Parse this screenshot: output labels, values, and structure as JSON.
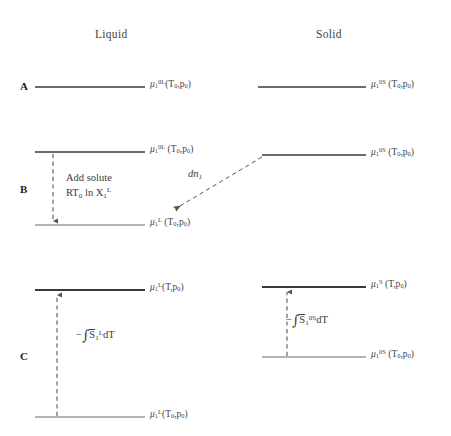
{
  "figure": {
    "background": "#ffffff",
    "width": 451,
    "height": 436
  },
  "colors": {
    "level_dark": "#3a3a3a",
    "level_light": "#9a9a9a",
    "arrow": "#555555",
    "text": "#3c3c3c",
    "row_label": "#1d1d1d"
  },
  "columns": [
    {
      "id": "liquid",
      "label": "Liquid",
      "x": 95,
      "y": 28
    },
    {
      "id": "solid",
      "label": "Solid",
      "x": 316,
      "y": 28
    }
  ],
  "rows": [
    {
      "id": "A",
      "label": "A",
      "x": 20,
      "y": 80
    },
    {
      "id": "B",
      "label": "B",
      "x": 20,
      "y": 183
    },
    {
      "id": "C",
      "label": "C",
      "x": 20,
      "y": 350
    }
  ],
  "levels": [
    {
      "id": "A-liquid",
      "row": "A",
      "column": "liquid",
      "x1": 35,
      "x2": 145,
      "y": 87,
      "shade": "dark",
      "label_html": "<span class=\"mu\">&mu;</span><sub>1</sub><sup>0L</sup>(T<sub>0</sub>,p<sub>0</sub>)",
      "label_text": "mu_1^0L (T0,p0)",
      "label_x": 150,
      "label_y": 80
    },
    {
      "id": "A-solid",
      "row": "A",
      "column": "solid",
      "x1": 258,
      "x2": 366,
      "y": 87,
      "shade": "dark",
      "label_html": "<span class=\"mu\">&mu;</span><sub>1</sub><sup>0S</sup> (T<sub>0</sub>,p<sub>0</sub>)",
      "label_text": "mu_1^0S (T0,p0)",
      "label_x": 371,
      "label_y": 80
    },
    {
      "id": "B-liquid-upper",
      "row": "B",
      "column": "liquid",
      "x1": 35,
      "x2": 145,
      "y": 152,
      "shade": "dark",
      "label_html": "<span class=\"mu\">&mu;</span><sub>1</sub><sup>0L</sup> (T<sub>0</sub>,p<sub>0</sub>)",
      "label_text": "mu_1^0L (T0,p0)",
      "label_x": 150,
      "label_y": 145
    },
    {
      "id": "B-liquid-lower",
      "row": "B",
      "column": "liquid",
      "x1": 35,
      "x2": 145,
      "y": 225,
      "shade": "light",
      "label_html": "<span class=\"mu\">&mu;</span><sub>1</sub><sup>L</sup> (T<sub>0</sub>,p<sub>0</sub>)",
      "label_text": "mu_1^L (T0,p0)",
      "label_x": 150,
      "label_y": 218
    },
    {
      "id": "B-solid",
      "row": "B",
      "column": "solid",
      "x1": 262,
      "x2": 366,
      "y": 155,
      "shade": "dark",
      "label_html": "<span class=\"mu\">&mu;</span><sub>1</sub><sup>0S</sup> (T<sub>0</sub>,p<sub>0</sub>)",
      "label_text": "mu_1^0S (T0,p0)",
      "label_x": 371,
      "label_y": 148
    },
    {
      "id": "C-liquid-upper",
      "row": "C",
      "column": "liquid",
      "x1": 35,
      "x2": 145,
      "y": 290,
      "shade": "dark",
      "label_html": "<span class=\"mu\">&mu;</span><sub>1</sub><sup>L</sup>(T,p<sub>0</sub>)",
      "label_text": "mu_1^L (T,p0)",
      "label_x": 150,
      "label_y": 283
    },
    {
      "id": "C-liquid-lower",
      "row": "C",
      "column": "liquid",
      "x1": 35,
      "x2": 145,
      "y": 417,
      "shade": "light",
      "label_html": "<span class=\"mu\">&mu;</span><sub>1</sub><sup>L</sup>(T<sub>0</sub>,p<sub>0</sub>)",
      "label_text": "mu_1^L (T0,p0)",
      "label_x": 150,
      "label_y": 410
    },
    {
      "id": "C-solid-upper",
      "row": "C",
      "column": "solid",
      "x1": 262,
      "x2": 366,
      "y": 287,
      "shade": "dark",
      "label_html": "<span class=\"mu\">&mu;</span><sub>1</sub><sup>S</sup> (T,p<sub>0</sub>)",
      "label_text": "mu_1^S (T,p0)",
      "label_x": 371,
      "label_y": 280
    },
    {
      "id": "C-solid-lower",
      "row": "C",
      "column": "solid",
      "x1": 262,
      "x2": 366,
      "y": 357,
      "shade": "light",
      "label_html": "<span class=\"mu\">&mu;</span><sub>1</sub><sup>0S</sup> (T<sub>0</sub>,p<sub>0</sub>)",
      "label_text": "mu_1^0S (T0,p0)",
      "label_x": 371,
      "label_y": 350
    }
  ],
  "arrows": [
    {
      "id": "B-add-solute-arrow",
      "style": "dashed",
      "direction": "down",
      "x1": 53,
      "y1": 154,
      "x2": 53,
      "y2": 224
    },
    {
      "id": "B-dn1-transfer-arrow",
      "style": "dashed",
      "direction": "down-left",
      "x1": 262,
      "y1": 157,
      "x2": 170,
      "y2": 212
    },
    {
      "id": "C-liquid-entropy-arrow",
      "style": "dashed",
      "direction": "up",
      "x1": 57,
      "y1": 416,
      "x2": 57,
      "y2": 293
    },
    {
      "id": "C-solid-entropy-arrow",
      "style": "dashed",
      "direction": "up",
      "x1": 287,
      "y1": 356,
      "x2": 287,
      "y2": 290
    }
  ],
  "annotations": [
    {
      "id": "add-solute-note",
      "x": 66,
      "y": 170,
      "lines": [
        "Add solute",
        "RT<sub>0</sub> ln X<sub>1</sub><sup>L</sup>"
      ],
      "lines_text": [
        "Add solute",
        "RT0 ln X_1^L"
      ]
    }
  ],
  "flux": {
    "id": "dn1-label",
    "x": 188,
    "y": 168,
    "html": "dn<sub>1</sub>",
    "text": "dn_1"
  },
  "integrals": [
    {
      "id": "liquid-entropy-integral",
      "x": 76,
      "y": 327,
      "html": "&minus;<span class=\"intsym\">&#8747;</span><span class=\"ovl\">S</span><sub>1</sub><sup>L</sup>dT",
      "text": "- int S-bar_1^L dT"
    },
    {
      "id": "solid-entropy-integral",
      "x": 286,
      "y": 312,
      "html": "&minus;<span class=\"intsym\">&#8747;</span><span class=\"ovl\">S</span><sub>1</sub><sup>0S</sup>dT",
      "text": "- int S-bar_1^0S dT"
    }
  ]
}
